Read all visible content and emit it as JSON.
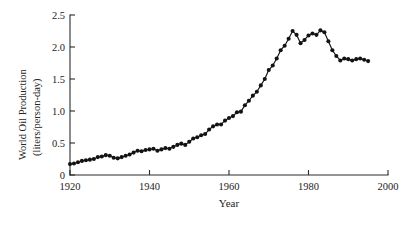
{
  "chart_data": {
    "type": "line",
    "title": "",
    "subtitle": "",
    "xlabel": "Year",
    "ylabel": "World Oil Production (liters/person-day)",
    "ylabel_line1": "World Oil Production",
    "ylabel_line2": "(liters/person-day)",
    "xlim": [
      1920,
      2000
    ],
    "ylim": [
      0,
      2.5
    ],
    "xticks": [
      1920,
      1940,
      1960,
      1980,
      2000
    ],
    "xtick_labels": [
      "1920",
      "1940",
      "1960",
      "1980",
      "2000"
    ],
    "yticks": [
      0,
      0.5,
      1.0,
      1.5,
      2.0,
      2.5
    ],
    "ytick_labels": [
      "0",
      "0.5",
      "1.0",
      "1.5",
      "2.0",
      "2.5"
    ],
    "grid": false,
    "legend": null,
    "marker": "filled-circle",
    "line_color": "#141414",
    "marker_color": "#131313",
    "series": [
      {
        "name": "World oil production per person",
        "x": [
          1920,
          1921,
          1922,
          1923,
          1924,
          1925,
          1926,
          1927,
          1928,
          1929,
          1930,
          1931,
          1932,
          1933,
          1934,
          1935,
          1936,
          1937,
          1938,
          1939,
          1940,
          1941,
          1942,
          1943,
          1944,
          1945,
          1946,
          1947,
          1948,
          1949,
          1950,
          1951,
          1952,
          1953,
          1954,
          1955,
          1956,
          1957,
          1958,
          1959,
          1960,
          1961,
          1962,
          1963,
          1964,
          1965,
          1966,
          1967,
          1968,
          1969,
          1970,
          1971,
          1972,
          1973,
          1974,
          1975,
          1976,
          1977,
          1978,
          1979,
          1980,
          1981,
          1982,
          1983,
          1984,
          1985,
          1986,
          1987,
          1988,
          1989,
          1990,
          1991,
          1992,
          1993,
          1994,
          1995
        ],
        "y": [
          0.17,
          0.18,
          0.2,
          0.22,
          0.23,
          0.24,
          0.25,
          0.28,
          0.29,
          0.31,
          0.3,
          0.27,
          0.26,
          0.28,
          0.3,
          0.32,
          0.35,
          0.38,
          0.37,
          0.39,
          0.4,
          0.41,
          0.38,
          0.4,
          0.42,
          0.41,
          0.44,
          0.47,
          0.49,
          0.47,
          0.52,
          0.57,
          0.59,
          0.62,
          0.64,
          0.71,
          0.76,
          0.79,
          0.79,
          0.85,
          0.89,
          0.92,
          0.98,
          0.99,
          1.09,
          1.16,
          1.24,
          1.3,
          1.4,
          1.5,
          1.64,
          1.71,
          1.82,
          1.95,
          2.02,
          2.13,
          2.25,
          2.19,
          2.06,
          2.11,
          2.18,
          2.21,
          2.19,
          2.26,
          2.23,
          2.09,
          1.95,
          1.86,
          1.79,
          1.82,
          1.81,
          1.79,
          1.81,
          1.82,
          1.8,
          1.78
        ],
        "y_note": "estimated from pixel positions"
      }
    ]
  }
}
